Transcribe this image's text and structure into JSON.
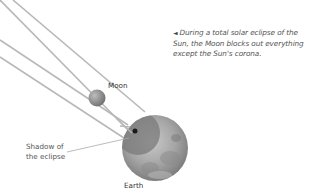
{
  "caption": {
    "marker": "◄",
    "text": "During a total solar eclipse of the Sun, the Moon blocks out everything except the Sun's corona."
  },
  "labels": {
    "moon": "Moon",
    "earth": "Earth",
    "shadow_line1": "Shadow of",
    "shadow_line2": "the eclipse"
  },
  "colors": {
    "rays": "#b5b5b5",
    "earth": "#9a9a9a",
    "moon": "#8f8f8f",
    "shadow": "#6e6e6e",
    "text": "#555555"
  }
}
